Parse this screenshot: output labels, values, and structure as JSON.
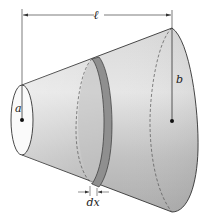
{
  "figure": {
    "labels": {
      "length": "ℓ",
      "small_radius": "a",
      "large_radius": "b",
      "slice_thickness": "dx"
    }
  },
  "colors": {
    "background": "#ffffff",
    "cone_fill_light": "#e4e4e4",
    "cone_fill_mid": "#c4c4c4",
    "cone_fill_dark": "#a8a8a8",
    "slice_band": "#8e8e8e",
    "outline": "#333333",
    "small_end_face": "#fafafa"
  }
}
